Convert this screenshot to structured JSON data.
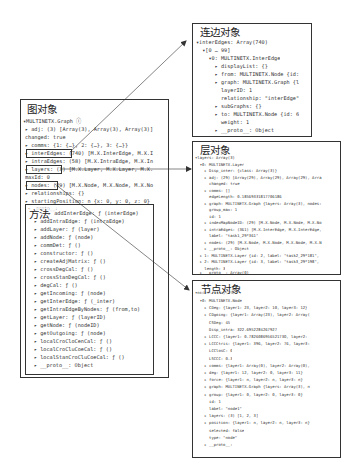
{
  "graph_box": {
    "title": "图对象",
    "header": "▾MULTINETX.Graph ⓘ",
    "lines": [
      "▸ adj: (3) [Array(3), Array(3), Array(3)]",
      "  changed: true",
      "▸ comms: {1: {…}, 2: {…}, 3: {…}}",
      "▸ interEdges: (740) [M.X.InterEdge, M.X.I",
      "▸ intraEdges: (58) [M.X.IntraEdge, M.X.In",
      "▸ layers: (3) [M.X.Layer, M.X.Layer, M.X.",
      "  maxId: 0",
      "▸ nodes: (29) [M.X.Node, M.X.Node, M.X.No",
      "▸ relationships: {}",
      "▸ startingPosition: n {x: 0, y: 0, z: 0}"
    ],
    "highlighted_keys": [
      "interEdges",
      "layers",
      "nodes"
    ]
  },
  "methods_box": {
    "title": "方法",
    "proto_label": "▾__proto__:",
    "lines": [
      "▸ addInterEdge: ƒ (interEdge)",
      "▸ addIntraEdge: ƒ (intraEdge)",
      "▸ addLayer: ƒ (layer)",
      "▸ addNode: ƒ (node)",
      "▸ commDet: ƒ ()",
      "▸ constructor: ƒ ()",
      "▸ createAdjMatrix: ƒ ()",
      "▸ crossDegCal: ƒ ()",
      "▸ crossStanDegCal: ƒ ()",
      "▸ degCal: ƒ ()",
      "▸ getIncoming: ƒ (node)",
      "▸ getInterEdge: ƒ (_inter)",
      "▸ getIntraEdgeByNodes: ƒ (from,to)",
      "▸ getLayer: ƒ (layerID)",
      "▸ getNode: ƒ (nodeID)",
      "▸ getOutgoing: ƒ (node)",
      "▸ localCroCloCenCal: ƒ ()",
      "▸ localCroCluCoeCal: ƒ ()",
      "▸ localStanCroCluCoeCal: ƒ ()",
      "▸ __proto__: Object"
    ]
  },
  "edge_box": {
    "title": "连边对象",
    "lines": [
      "▾interEdges: Array(740)",
      "  ▾[0 … 99]",
      "    ▾0: MULTINETX.InterEdge",
      "      ▸ displayList: {}",
      "      ▸ from: MULTINETX.Node {id:",
      "      ▸ graph: MULTINETX.Graph {l",
      "        layerID: 1",
      "        relationship: \"interEdge\"",
      "      ▸ subGraphs: {}",
      "      ▸ to: MULTINETX.Node {id: 6",
      "        weight: 1",
      "      ▸ __proto__: Object"
    ]
  },
  "layer_box": {
    "title": "层对象",
    "lines": [
      "▾layers: Array(3)",
      "  ▾0: MULTINETX.Layer",
      "    ▸ Disp_inter: {class: Array(3)}",
      "    ▸ adj: (29) [Array(29), Array(29), Array(29), Arra",
      "      changed: true",
      "    ▸ comms: []",
      "      edgeLength: 0.18569331817706186",
      "    ▸ graph: MULTINETX.Graph {layers: Array(3), nodes:",
      "      group_max: 1",
      "      id: 1",
      "    ▸ indexMapNodeID: (29) [M.X.Node, M.X.Node, M.X.No",
      "    ▸ intraEdges: (361) [M.X.InterEdge, M.X.InterEdge,",
      "      label: \"task1_29*361\"",
      "    ▸ nodes: (29) [M.X.Node, M.X.Node, M.X.Node, M.X.N",
      "    ▸ __proto__: Object",
      "  ▸ 1: MULTINETX.Layer {id: 2, label: \"task2_29*181\",",
      "  ▸ 2: MULTINETX.Layer {id: 3, label: \"task3_29*198\",",
      "    length: 3",
      "  ▸ __proto__: Array(0)"
    ]
  },
  "node_box": {
    "title": "节点对象",
    "header_suffix": "▾nodes: Array(29)",
    "lines": [
      "  ▾0: MULTINETX.Node",
      "    ▸ CDeg: {layer1: 23, layer2: 10, layer3: 12}",
      "    ▸ CDgoing: {layer1: Array(23), layer2: Array(",
      "      CSDeg: 45",
      "      Disp_intra: 322.6952284267927",
      "    ▸ LCCC: {layer1: 0.782608695652173O, layer2:",
      "    ▸ LCCCtris: {layer1: 396, layer2: 76, layer3:",
      "      LCClosC: 0",
      "      LSCCC: 0.3",
      "    ▸ comms: {layer1: Array(0), layer2: Array(0),",
      "    ▸ deg: {layer1: 12, layer2: 0, layer3: 11}",
      "    ▸ force: {layer1: n, layer2: n, layer3: n}",
      "    ▸ graph: MULTINETX.Graph {layers: Array(3), n",
      "    ▸ group: {layer1: 0, layer2: 0, layer3: 0}",
      "      id: 1",
      "      label: \"node1\"",
      "    ▸ layers: (3) [1, 2, 3]",
      "    ▸ position: {layer1: n, layer2: n, layer3: n}",
      "      selected: false",
      "      type: \"node\"",
      "    ▸ __proto__:"
    ]
  },
  "arrows": [
    {
      "name": "arrow-interedges-to-edge-object",
      "from": "interEdges",
      "to": "连边对象"
    },
    {
      "name": "arrow-layers-to-layer-object",
      "from": "layers",
      "to": "层对象"
    },
    {
      "name": "arrow-nodes-to-node-object",
      "from": "nodes",
      "to": "节点对象"
    }
  ],
  "colors": {
    "border": "#333333",
    "text": "#444444",
    "background": "#ffffff"
  }
}
